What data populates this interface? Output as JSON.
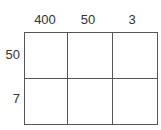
{
  "chart_data": {
    "type": "table",
    "title": "",
    "xlabel": "",
    "ylabel": "",
    "grid": true,
    "legend_position": "none",
    "column_headers": [
      "400",
      "50",
      "3"
    ],
    "row_headers": [
      "50",
      "7"
    ],
    "rows": [
      [
        "",
        "",
        ""
      ],
      [
        "",
        "",
        ""
      ]
    ]
  },
  "colors": {
    "background": "#ffffff",
    "outer_border": "#222222",
    "inner_line": "#555555",
    "text": "#333333"
  },
  "headers": {
    "columns": [
      {
        "label": "400"
      },
      {
        "label": "50"
      },
      {
        "label": "3"
      }
    ],
    "rows": [
      {
        "label": "50"
      },
      {
        "label": "7"
      }
    ]
  },
  "cells": {
    "row0": [
      {
        "value": ""
      },
      {
        "value": ""
      },
      {
        "value": ""
      }
    ],
    "row1": [
      {
        "value": ""
      },
      {
        "value": ""
      },
      {
        "value": ""
      }
    ]
  }
}
